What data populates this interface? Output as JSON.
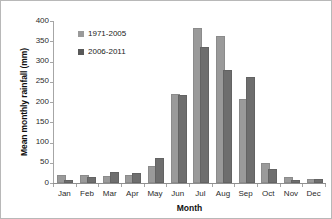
{
  "chart_data": {
    "type": "bar",
    "title": "",
    "xlabel": "Month",
    "ylabel": "Mean monthly rainfall (mm)",
    "ylim": [
      0,
      400
    ],
    "ytick_step": 50,
    "yticks": [
      400,
      350,
      300,
      250,
      200,
      150,
      100,
      50,
      0
    ],
    "grid": false,
    "legend_position": "upper-left-inside",
    "categories": [
      "Jan",
      "Feb",
      "Mar",
      "Apr",
      "May",
      "Jun",
      "Jul",
      "Aug",
      "Sep",
      "Oct",
      "Nov",
      "Dec"
    ],
    "series": [
      {
        "name": "1971-2005",
        "color": "#9a9a9a",
        "values": [
          15,
          15,
          13,
          14,
          38,
          216,
          378,
          358,
          202,
          45,
          11,
          4
        ]
      },
      {
        "name": "2006-2011",
        "color": "#6e6e6e",
        "values": [
          2,
          11,
          23,
          21,
          56,
          213,
          330,
          275,
          258,
          30,
          2,
          5
        ]
      }
    ]
  }
}
